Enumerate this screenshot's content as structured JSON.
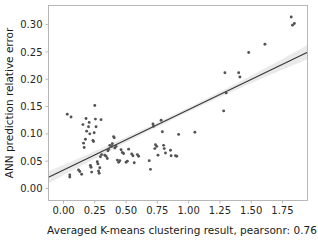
{
  "chart_data": {
    "type": "scatter",
    "title": "",
    "xlabel": "Averaged K-means clustering result, pearsonr: 0.76",
    "ylabel": "ANN prediction relative error",
    "xlim": [
      -0.12,
      1.95
    ],
    "ylim": [
      -0.022,
      0.335
    ],
    "xticks": [
      0.0,
      0.25,
      0.5,
      0.75,
      1.0,
      1.25,
      1.5,
      1.75
    ],
    "xticklabels": [
      "0.00",
      "0.25",
      "0.50",
      "0.75",
      "1.00",
      "1.25",
      "1.50",
      "1.75"
    ],
    "yticks": [
      0.0,
      0.05,
      0.1,
      0.15,
      0.2,
      0.25,
      0.3
    ],
    "yticklabels": [
      "0.00",
      "0.05",
      "0.10",
      "0.15",
      "0.20",
      "0.25",
      "0.30"
    ],
    "grid": false,
    "legend": null,
    "pearsonr": 0.76,
    "marker_color": "#535353",
    "line_color": "#3a3a3a",
    "band_color": "#d8d8d8",
    "regression": {
      "x0": -0.12,
      "y0": 0.0205,
      "x1": 1.95,
      "y1": 0.2495,
      "band_halfwidth_left": 0.011,
      "band_halfwidth_mid": 0.004,
      "band_halfwidth_right": 0.013
    },
    "points": [
      [
        0.03,
        0.136
      ],
      [
        0.06,
        0.131
      ],
      [
        0.05,
        0.025
      ],
      [
        0.05,
        0.021
      ],
      [
        0.12,
        0.034
      ],
      [
        0.13,
        0.031
      ],
      [
        0.145,
        0.026
      ],
      [
        0.155,
        0.117
      ],
      [
        0.16,
        0.083
      ],
      [
        0.165,
        0.075
      ],
      [
        0.175,
        0.09
      ],
      [
        0.18,
        0.128
      ],
      [
        0.185,
        0.105
      ],
      [
        0.2,
        0.113
      ],
      [
        0.205,
        0.121
      ],
      [
        0.21,
        0.1
      ],
      [
        0.215,
        0.042
      ],
      [
        0.22,
        0.039
      ],
      [
        0.225,
        0.03
      ],
      [
        0.235,
        0.088
      ],
      [
        0.24,
        0.086
      ],
      [
        0.245,
        0.102
      ],
      [
        0.25,
        0.152
      ],
      [
        0.255,
        0.127
      ],
      [
        0.26,
        0.113
      ],
      [
        0.27,
        0.049
      ],
      [
        0.275,
        0.045
      ],
      [
        0.28,
        0.032
      ],
      [
        0.285,
        0.028
      ],
      [
        0.29,
        0.038
      ],
      [
        0.295,
        0.058
      ],
      [
        0.3,
        0.126
      ],
      [
        0.305,
        0.062
      ],
      [
        0.33,
        0.061
      ],
      [
        0.34,
        0.059
      ],
      [
        0.35,
        0.055
      ],
      [
        0.355,
        0.069
      ],
      [
        0.36,
        0.072
      ],
      [
        0.37,
        0.079
      ],
      [
        0.385,
        0.077
      ],
      [
        0.39,
        0.082
      ],
      [
        0.4,
        0.095
      ],
      [
        0.405,
        0.093
      ],
      [
        0.41,
        0.074
      ],
      [
        0.42,
        0.077
      ],
      [
        0.43,
        0.052
      ],
      [
        0.44,
        0.048
      ],
      [
        0.45,
        0.051
      ],
      [
        0.46,
        0.071
      ],
      [
        0.47,
        0.066
      ],
      [
        0.48,
        0.064
      ],
      [
        0.5,
        0.048
      ],
      [
        0.51,
        0.05
      ],
      [
        0.52,
        0.072
      ],
      [
        0.545,
        0.063
      ],
      [
        0.555,
        0.06
      ],
      [
        0.565,
        0.047
      ],
      [
        0.59,
        0.062
      ],
      [
        0.6,
        0.059
      ],
      [
        0.685,
        0.051
      ],
      [
        0.695,
        0.035
      ],
      [
        0.715,
        0.118
      ],
      [
        0.72,
        0.114
      ],
      [
        0.73,
        0.073
      ],
      [
        0.735,
        0.08
      ],
      [
        0.745,
        0.077
      ],
      [
        0.755,
        0.061
      ],
      [
        0.78,
        0.125
      ],
      [
        0.79,
        0.104
      ],
      [
        0.8,
        0.079
      ],
      [
        0.805,
        0.073
      ],
      [
        0.815,
        0.065
      ],
      [
        0.855,
        0.07
      ],
      [
        0.86,
        0.06
      ],
      [
        0.895,
        0.06
      ],
      [
        0.905,
        0.059
      ],
      [
        0.92,
        0.099
      ],
      [
        1.05,
        0.103
      ],
      [
        1.28,
        0.142
      ],
      [
        1.29,
        0.212
      ],
      [
        1.3,
        0.175
      ],
      [
        1.4,
        0.212
      ],
      [
        1.41,
        0.204
      ],
      [
        1.48,
        0.249
      ],
      [
        1.61,
        0.264
      ],
      [
        1.82,
        0.314
      ],
      [
        1.83,
        0.299
      ],
      [
        1.845,
        0.302
      ]
    ]
  }
}
